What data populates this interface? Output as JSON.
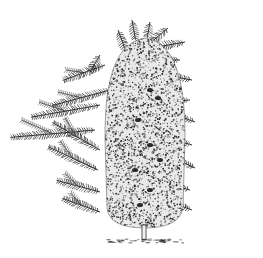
{
  "image": {
    "subject": "botanical engraving of a columnar conifer tree with surrounding foliage sprigs",
    "style": "black ink stipple / hatching on white",
    "width": 263,
    "height": 258,
    "colors": {
      "background": "#ffffff",
      "ink": "#2a2a2a",
      "ink_light": "#6a6a6a"
    },
    "crown": {
      "cx": 145,
      "top": 38,
      "bottom": 228,
      "half_width": 40
    },
    "trunk": {
      "x": 144,
      "top": 225,
      "bottom": 240
    },
    "ground": {
      "y": 240,
      "x1": 106,
      "x2": 184
    },
    "sprigs": [
      {
        "x": 118,
        "y": 30,
        "len": 22,
        "angle": 70,
        "side": "top"
      },
      {
        "x": 132,
        "y": 20,
        "len": 20,
        "angle": 80,
        "side": "top"
      },
      {
        "x": 150,
        "y": 22,
        "len": 16,
        "angle": 100,
        "side": "top"
      },
      {
        "x": 168,
        "y": 28,
        "len": 22,
        "angle": 140,
        "side": "top"
      },
      {
        "x": 185,
        "y": 42,
        "len": 38,
        "angle": 170,
        "side": "right"
      },
      {
        "x": 180,
        "y": 60,
        "len": 50,
        "angle": 180,
        "side": "right"
      },
      {
        "x": 192,
        "y": 80,
        "len": 45,
        "angle": 190,
        "side": "right"
      },
      {
        "x": 190,
        "y": 100,
        "len": 48,
        "angle": 175,
        "side": "right"
      },
      {
        "x": 195,
        "y": 122,
        "len": 50,
        "angle": 200,
        "side": "right"
      },
      {
        "x": 192,
        "y": 145,
        "len": 55,
        "angle": 195,
        "side": "right"
      },
      {
        "x": 195,
        "y": 168,
        "len": 52,
        "angle": 205,
        "side": "right"
      },
      {
        "x": 190,
        "y": 190,
        "len": 50,
        "angle": 195,
        "side": "right"
      },
      {
        "x": 192,
        "y": 210,
        "len": 52,
        "angle": 200,
        "side": "right"
      },
      {
        "x": 100,
        "y": 55,
        "len": 20,
        "angle": 120,
        "side": "left"
      },
      {
        "x": 105,
        "y": 65,
        "len": 45,
        "angle": 160,
        "side": "left"
      },
      {
        "x": 110,
        "y": 90,
        "len": 60,
        "angle": 165,
        "side": "left"
      },
      {
        "x": 100,
        "y": 105,
        "len": 70,
        "angle": 170,
        "side": "left"
      },
      {
        "x": 95,
        "y": 130,
        "len": 85,
        "angle": 175,
        "side": "left"
      },
      {
        "x": 100,
        "y": 150,
        "len": 55,
        "angle": 210,
        "side": "left"
      },
      {
        "x": 98,
        "y": 170,
        "len": 55,
        "angle": 205,
        "side": "left"
      },
      {
        "x": 100,
        "y": 192,
        "len": 45,
        "angle": 195,
        "side": "left"
      },
      {
        "x": 100,
        "y": 212,
        "len": 40,
        "angle": 200,
        "side": "left"
      }
    ]
  }
}
